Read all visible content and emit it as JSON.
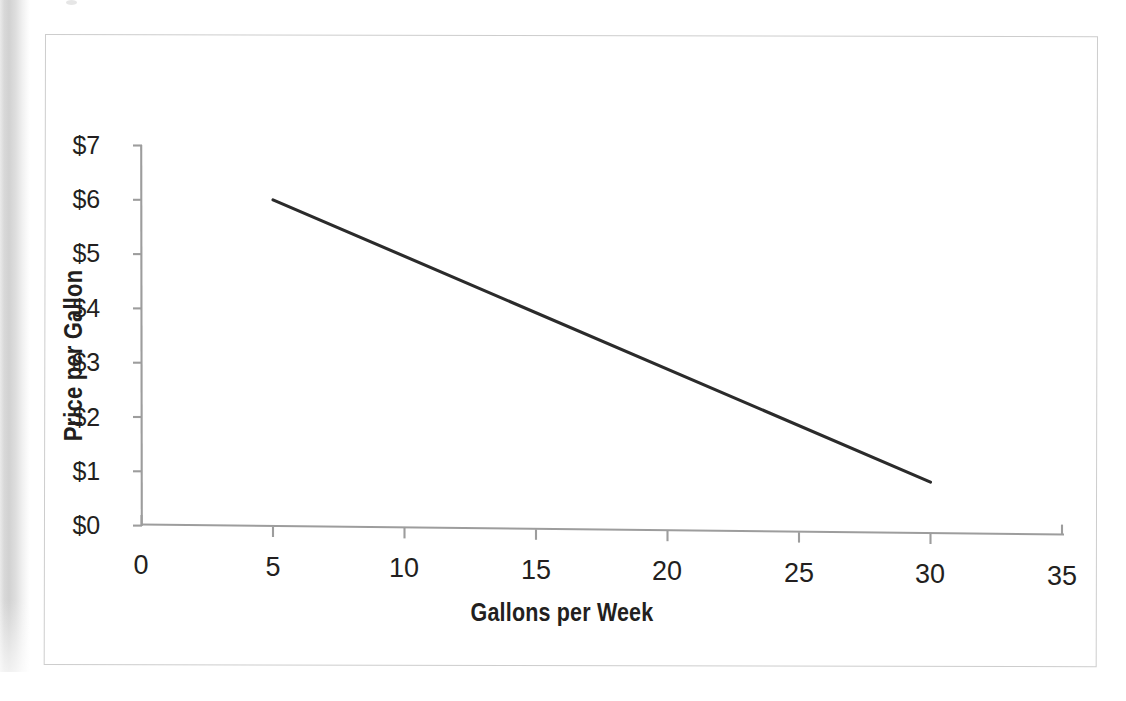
{
  "page": {
    "background_color": "#ffffff",
    "frame_border_color": "#cdcdcd",
    "text_color": "#231f20"
  },
  "chart_data": {
    "type": "line",
    "title": "",
    "subtitle": "",
    "xlabel": "Gallons per Week",
    "ylabel": "Price per Gallon",
    "xlim": [
      0,
      35
    ],
    "ylim": [
      0,
      7
    ],
    "xticks": [
      0,
      5,
      10,
      15,
      20,
      25,
      30,
      35
    ],
    "yticks": [
      0,
      1,
      2,
      3,
      4,
      5,
      6,
      7
    ],
    "xtick_labels": [
      "0",
      "5",
      "10",
      "15",
      "20",
      "25",
      "30",
      "35"
    ],
    "ytick_labels": [
      "$0",
      "$1",
      "$2",
      "$3",
      "$4",
      "$5",
      "$6",
      "$7"
    ],
    "grid": false,
    "legend": false,
    "legend_position": "none",
    "line_color": "#2b2b2b",
    "axis_color": "#9a9a9a",
    "series": [
      {
        "name": "Demand",
        "x": [
          5,
          30
        ],
        "y": [
          6.0,
          0.8
        ]
      }
    ]
  },
  "axes": {
    "y": {
      "title": "Price per Gallon",
      "labels": [
        "$7",
        "$6",
        "$5",
        "$4",
        "$3",
        "$2",
        "$1",
        "$0"
      ]
    },
    "x": {
      "title": "Gallons per Week",
      "labels": [
        "0",
        "5",
        "10",
        "15",
        "20",
        "25",
        "30",
        "35"
      ]
    }
  }
}
